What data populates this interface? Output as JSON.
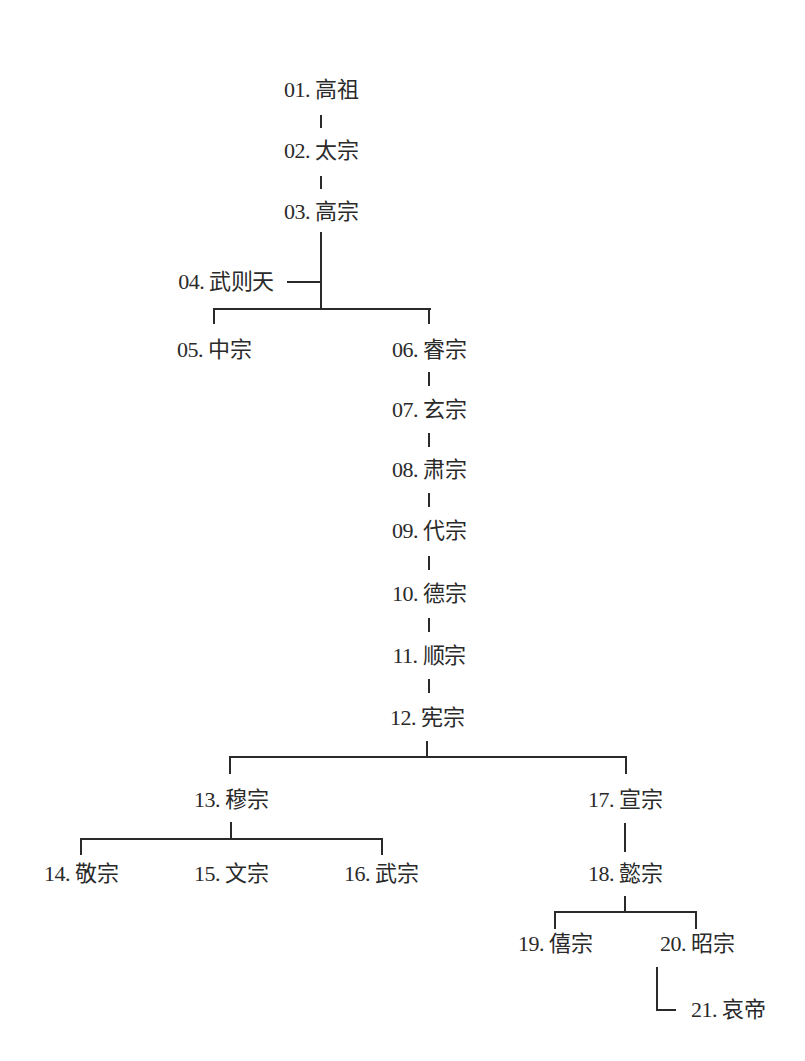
{
  "diagram": {
    "type": "genealogy-tree",
    "line_color": "#2a2a2a",
    "background": "#ffffff",
    "nodes": [
      {
        "id": "01",
        "num": "01.",
        "name": "高祖",
        "x": 321,
        "y": 90
      },
      {
        "id": "02",
        "num": "02.",
        "name": "太宗",
        "x": 321,
        "y": 151
      },
      {
        "id": "03",
        "num": "03.",
        "name": "高宗",
        "x": 321,
        "y": 212
      },
      {
        "id": "04",
        "num": "04.",
        "name": "武则天",
        "x": 226,
        "y": 282
      },
      {
        "id": "05",
        "num": "05.",
        "name": "中宗",
        "x": 214,
        "y": 350
      },
      {
        "id": "06",
        "num": "06.",
        "name": "睿宗",
        "x": 429,
        "y": 350
      },
      {
        "id": "07",
        "num": "07.",
        "name": "玄宗",
        "x": 429,
        "y": 410
      },
      {
        "id": "08",
        "num": "08.",
        "name": "肃宗",
        "x": 429,
        "y": 470
      },
      {
        "id": "09",
        "num": "09.",
        "name": "代宗",
        "x": 429,
        "y": 531
      },
      {
        "id": "10",
        "num": "10.",
        "name": "德宗",
        "x": 429,
        "y": 594
      },
      {
        "id": "11",
        "num": "11.",
        "name": "顺宗",
        "x": 429,
        "y": 656
      },
      {
        "id": "12",
        "num": "12.",
        "name": "宪宗",
        "x": 427,
        "y": 718
      },
      {
        "id": "13",
        "num": "13.",
        "name": "穆宗",
        "x": 231,
        "y": 800
      },
      {
        "id": "14",
        "num": "14.",
        "name": "敬宗",
        "x": 81,
        "y": 874
      },
      {
        "id": "15",
        "num": "15.",
        "name": "文宗",
        "x": 231,
        "y": 874
      },
      {
        "id": "16",
        "num": "16.",
        "name": "武宗",
        "x": 381,
        "y": 874
      },
      {
        "id": "17",
        "num": "17.",
        "name": "宣宗",
        "x": 625,
        "y": 800
      },
      {
        "id": "18",
        "num": "18.",
        "name": "懿宗",
        "x": 625,
        "y": 874
      },
      {
        "id": "19",
        "num": "19.",
        "name": "僖宗",
        "x": 555,
        "y": 944
      },
      {
        "id": "20",
        "num": "20.",
        "name": "昭宗",
        "x": 697,
        "y": 944
      },
      {
        "id": "21",
        "num": "21.",
        "name": "哀帝",
        "x": 728,
        "y": 1010
      }
    ],
    "edges": [
      {
        "from": "01",
        "to": "02"
      },
      {
        "from": "02",
        "to": "03"
      },
      {
        "from": "03",
        "to": "04",
        "relation": "consort"
      },
      {
        "from": "03",
        "to": "05"
      },
      {
        "from": "03",
        "to": "06"
      },
      {
        "from": "06",
        "to": "07"
      },
      {
        "from": "07",
        "to": "08"
      },
      {
        "from": "08",
        "to": "09"
      },
      {
        "from": "09",
        "to": "10"
      },
      {
        "from": "10",
        "to": "11"
      },
      {
        "from": "11",
        "to": "12"
      },
      {
        "from": "12",
        "to": "13"
      },
      {
        "from": "12",
        "to": "17"
      },
      {
        "from": "13",
        "to": "14"
      },
      {
        "from": "13",
        "to": "15"
      },
      {
        "from": "13",
        "to": "16"
      },
      {
        "from": "17",
        "to": "18"
      },
      {
        "from": "18",
        "to": "19"
      },
      {
        "from": "18",
        "to": "20"
      },
      {
        "from": "20",
        "to": "21"
      }
    ],
    "lines": {
      "h": [
        {
          "x": 287,
          "y": 281,
          "w": 35
        },
        {
          "x": 213,
          "y": 308,
          "w": 218
        },
        {
          "x": 229,
          "y": 756,
          "w": 398
        },
        {
          "x": 80,
          "y": 838,
          "w": 303
        },
        {
          "x": 554,
          "y": 911,
          "w": 143
        },
        {
          "x": 656,
          "y": 1009,
          "w": 20
        }
      ],
      "v": [
        {
          "x": 320,
          "y": 115,
          "h": 13
        },
        {
          "x": 320,
          "y": 176,
          "h": 13
        },
        {
          "x": 320,
          "y": 232,
          "h": 78
        },
        {
          "x": 213,
          "y": 308,
          "h": 16
        },
        {
          "x": 428,
          "y": 308,
          "h": 16
        },
        {
          "x": 428,
          "y": 372,
          "h": 14
        },
        {
          "x": 428,
          "y": 433,
          "h": 14
        },
        {
          "x": 428,
          "y": 493,
          "h": 14
        },
        {
          "x": 428,
          "y": 556,
          "h": 14
        },
        {
          "x": 428,
          "y": 618,
          "h": 14
        },
        {
          "x": 428,
          "y": 679,
          "h": 14
        },
        {
          "x": 426,
          "y": 741,
          "h": 17
        },
        {
          "x": 229,
          "y": 756,
          "h": 18
        },
        {
          "x": 625,
          "y": 756,
          "h": 18
        },
        {
          "x": 230,
          "y": 822,
          "h": 18
        },
        {
          "x": 80,
          "y": 838,
          "h": 17
        },
        {
          "x": 381,
          "y": 838,
          "h": 17
        },
        {
          "x": 624,
          "y": 823,
          "h": 29
        },
        {
          "x": 624,
          "y": 896,
          "h": 16
        },
        {
          "x": 554,
          "y": 911,
          "h": 18
        },
        {
          "x": 695,
          "y": 911,
          "h": 18
        },
        {
          "x": 656,
          "y": 967,
          "h": 44
        }
      ]
    }
  }
}
